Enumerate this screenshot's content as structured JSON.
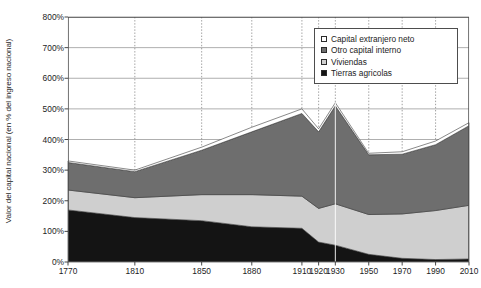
{
  "chart_data": {
    "type": "area",
    "stacked": true,
    "title": "",
    "subtitle": "",
    "xlabel": "",
    "ylabel": "Valor del capital nacional (en % del ingreso nacional)",
    "x": [
      1770,
      1810,
      1850,
      1880,
      1910,
      1920,
      1930,
      1950,
      1970,
      1990,
      2010
    ],
    "xticklabels": [
      "1770",
      "1810",
      "1850",
      "1880",
      "1910",
      "1920",
      "1930",
      "1950",
      "1970",
      "1990",
      "2010"
    ],
    "yticklabels": [
      "0%",
      "100%",
      "200%",
      "300%",
      "400%",
      "500%",
      "600%",
      "700%",
      "800%"
    ],
    "yticks": [
      0,
      100,
      200,
      300,
      400,
      500,
      600,
      700,
      800
    ],
    "ylim": [
      0,
      800
    ],
    "xlim": [
      1770,
      2010
    ],
    "grid": "horizontal-solid-and-vertical-dotted",
    "legend_position": "top-right",
    "series": [
      {
        "name": "Tierras agricolas",
        "color": "#141414",
        "values": [
          170,
          145,
          135,
          115,
          110,
          65,
          55,
          25,
          12,
          8,
          10
        ]
      },
      {
        "name": "Viviendas",
        "color": "#cfcfcf",
        "values": [
          65,
          65,
          85,
          105,
          105,
          110,
          135,
          130,
          145,
          160,
          175
        ]
      },
      {
        "name": "Otro capital interno",
        "color": "#6e6e6e",
        "values": [
          90,
          85,
          145,
          205,
          270,
          250,
          320,
          195,
          195,
          215,
          260
        ]
      },
      {
        "name": "Capital extranjero neto",
        "color": "#ffffff",
        "values": [
          5,
          5,
          10,
          15,
          15,
          10,
          10,
          5,
          8,
          12,
          10
        ]
      }
    ],
    "totals": [
      330,
      300,
      375,
      440,
      500,
      435,
      520,
      355,
      360,
      395,
      455
    ],
    "legend": [
      {
        "label": "Capital extranjero neto",
        "swatch": "#ffffff"
      },
      {
        "label": "Otro capital interno",
        "swatch": "#6e6e6e"
      },
      {
        "label": "Viviendas",
        "swatch": "#cfcfcf"
      },
      {
        "label": "Tierras agricolas",
        "swatch": "#141414"
      }
    ]
  }
}
